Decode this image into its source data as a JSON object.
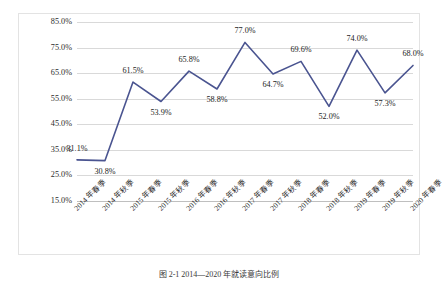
{
  "figure": {
    "caption": "图 2-1  2014—2020 年就读意向比例",
    "line_color": "#4a5490",
    "gridline_color": "#d9d9d9",
    "frame_color": "#e3e3e3",
    "background": "#ffffff"
  },
  "chart_data": {
    "type": "line",
    "title": "",
    "xlabel": "",
    "ylabel": "",
    "ylim": [
      15.0,
      85.0
    ],
    "ytick_step": 10.0,
    "grid": true,
    "legend": "none",
    "value_suffix": "%",
    "categories": [
      "2014 年春季",
      "2014 年秋季",
      "2015 年春季",
      "2015 年秋季",
      "2016 年春季",
      "2016 年秋季",
      "2017 年春季",
      "2017 年秋季",
      "2018 年春季",
      "2018 年秋季",
      "2019 年春季",
      "2019 年秋季",
      "2020 年春季"
    ],
    "values": [
      31.1,
      30.8,
      61.5,
      53.9,
      65.8,
      58.8,
      77.0,
      64.7,
      69.6,
      52.0,
      74.0,
      57.3,
      68.0
    ],
    "data_labels": [
      "31.1%",
      "30.8%",
      "61.5%",
      "53.9%",
      "65.8%",
      "58.8%",
      "77.0%",
      "64.7%",
      "69.6%",
      "52.0%",
      "74.0%",
      "57.3%",
      "68.0%"
    ],
    "label_positions": [
      "above",
      "below",
      "above",
      "below",
      "above",
      "below",
      "above",
      "below",
      "above",
      "below",
      "above",
      "below",
      "above"
    ],
    "ytick_labels": [
      "85.0%",
      "75.0%",
      "65.0%",
      "55.0%",
      "45.0%",
      "35.0%",
      "25.0%",
      "15.0%"
    ],
    "ytick_values": [
      85.0,
      75.0,
      65.0,
      55.0,
      45.0,
      35.0,
      25.0,
      15.0
    ]
  }
}
